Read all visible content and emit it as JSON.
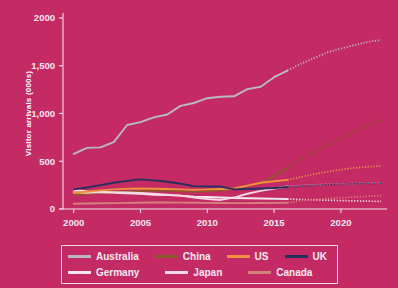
{
  "chart_data": {
    "type": "line",
    "title": "",
    "xlabel": "",
    "ylabel": "Visitor arrivals (000s)",
    "xlim": [
      1999.2,
      2023.6
    ],
    "ylim": [
      0,
      2000
    ],
    "xticks": [
      2000,
      2005,
      2010,
      2015,
      2020
    ],
    "xtick_labels": [
      "2000",
      "2005",
      "2010",
      "2015",
      "2020"
    ],
    "yticks": [
      0,
      500,
      1000,
      1500,
      2000
    ],
    "ytick_labels": [
      "0",
      "500",
      "1,000",
      "1,500",
      "2000"
    ],
    "grid": false,
    "legend_position": "below",
    "forecast_start_year": 2016,
    "series": [
      {
        "name": "Australia",
        "color": "#b9b9c6",
        "x": [
          2000,
          2001,
          2002,
          2003,
          2004,
          2005,
          2006,
          2007,
          2008,
          2009,
          2010,
          2011,
          2012,
          2013,
          2014,
          2015,
          2016
        ],
        "values": [
          578,
          640,
          645,
          700,
          880,
          910,
          960,
          990,
          1080,
          1110,
          1160,
          1175,
          1180,
          1255,
          1280,
          1380,
          1450
        ],
        "forecast_x": [
          2016,
          2017,
          2018,
          2019,
          2020,
          2021,
          2022,
          2023
        ],
        "forecast_values": [
          1450,
          1520,
          1580,
          1640,
          1680,
          1715,
          1750,
          1770
        ]
      },
      {
        "name": "Germany",
        "color": "#f7e6ed",
        "x": [
          2000,
          2001,
          2002,
          2003,
          2004,
          2005,
          2006,
          2007,
          2008,
          2009,
          2010,
          2011,
          2012,
          2013,
          2014,
          2015,
          2016
        ],
        "values": [
          200,
          185,
          175,
          170,
          165,
          160,
          150,
          145,
          140,
          130,
          125,
          120,
          115,
          112,
          110,
          108,
          105
        ],
        "forecast_x": [
          2016,
          2017,
          2018,
          2019,
          2020,
          2021,
          2022,
          2023
        ],
        "forecast_values": [
          105,
          100,
          96,
          92,
          88,
          85,
          82,
          80
        ]
      },
      {
        "name": "China",
        "color": "#8a5a2b",
        "x": [
          2000,
          2001,
          2002,
          2003,
          2004,
          2005,
          2006,
          2007,
          2008,
          2009,
          2010,
          2011,
          2012,
          2013,
          2014,
          2015,
          2016
        ],
        "values": [
          150,
          160,
          170,
          175,
          180,
          185,
          190,
          195,
          185,
          180,
          185,
          195,
          215,
          245,
          275,
          345,
          430
        ],
        "forecast_x": [
          2016,
          2017,
          2018,
          2019,
          2020,
          2021,
          2022,
          2023
        ],
        "forecast_values": [
          430,
          520,
          600,
          670,
          740,
          810,
          875,
          930
        ]
      },
      {
        "name": "Japan",
        "color": "#f6d9e3",
        "x": [
          2000,
          2001,
          2002,
          2003,
          2004,
          2005,
          2006,
          2007,
          2008,
          2009,
          2010,
          2011,
          2012,
          2013,
          2014,
          2015,
          2016
        ],
        "values": [
          175,
          170,
          178,
          175,
          172,
          168,
          160,
          150,
          140,
          120,
          105,
          95,
          120,
          160,
          190,
          215,
          235
        ],
        "forecast_x": [
          2016,
          2017,
          2018,
          2019,
          2020,
          2021,
          2022,
          2023
        ],
        "forecast_values": [
          235,
          245,
          252,
          258,
          262,
          266,
          270,
          272
        ]
      },
      {
        "name": "US",
        "color": "#f0913e",
        "x": [
          2000,
          2001,
          2002,
          2003,
          2004,
          2005,
          2006,
          2007,
          2008,
          2009,
          2010,
          2011,
          2012,
          2013,
          2014,
          2015,
          2016
        ],
        "values": [
          170,
          180,
          195,
          205,
          212,
          215,
          212,
          210,
          205,
          200,
          205,
          210,
          215,
          245,
          275,
          290,
          305
        ],
        "forecast_x": [
          2016,
          2017,
          2018,
          2019,
          2020,
          2021,
          2022,
          2023
        ],
        "forecast_values": [
          305,
          335,
          365,
          390,
          412,
          430,
          442,
          452
        ]
      },
      {
        "name": "UK",
        "color": "#243060",
        "x": [
          2000,
          2001,
          2002,
          2003,
          2004,
          2005,
          2006,
          2007,
          2008,
          2009,
          2010,
          2011,
          2012,
          2013,
          2014,
          2015,
          2016
        ],
        "values": [
          205,
          225,
          250,
          275,
          295,
          310,
          300,
          285,
          265,
          240,
          235,
          235,
          205,
          210,
          215,
          220,
          230
        ],
        "forecast_x": [
          2016,
          2017,
          2018,
          2019,
          2020,
          2021,
          2022,
          2023
        ],
        "forecast_values": [
          230,
          240,
          248,
          254,
          260,
          265,
          268,
          270
        ]
      },
      {
        "name": "Canada",
        "color": "#d4837a",
        "x": [
          2000,
          2001,
          2002,
          2003,
          2004,
          2005,
          2006,
          2007,
          2008,
          2009,
          2010,
          2011,
          2012,
          2013,
          2014,
          2015,
          2016
        ],
        "values": [
          55,
          58,
          60,
          62,
          64,
          66,
          68,
          68,
          67,
          65,
          64,
          63,
          62,
          62,
          63,
          64,
          65
        ],
        "forecast_x": [
          2016,
          2017,
          2018,
          2019,
          2020,
          2021,
          2022,
          2023
        ],
        "forecast_values": [
          65,
          88,
          100,
          110,
          118,
          126,
          133,
          140
        ]
      }
    ]
  },
  "legend": {
    "rows": [
      [
        {
          "label": "Australia",
          "color": "#b9b9c6"
        },
        {
          "label": "China",
          "color": "#8a5a2b"
        },
        {
          "label": "US",
          "color": "#f0913e"
        },
        {
          "label": "UK",
          "color": "#243060"
        }
      ],
      [
        {
          "label": "Germany",
          "color": "#f7e6ed"
        },
        {
          "label": "Japan",
          "color": "#f6d9e3"
        },
        {
          "label": "Canada",
          "color": "#d4837a"
        }
      ]
    ]
  },
  "colors": {
    "background": "#c42a63",
    "axis": "#f2dde6",
    "text": "#fdeaf1"
  }
}
